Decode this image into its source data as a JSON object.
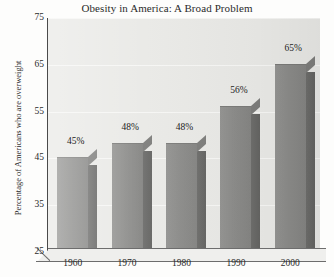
{
  "chart_data": {
    "type": "bar",
    "title": "Obesity in America: A Broad Problem",
    "xlabel": "",
    "ylabel": "Percentage of Americans who are overweight",
    "categories": [
      "1960",
      "1970",
      "1980",
      "1990",
      "2000"
    ],
    "values": [
      45,
      48,
      48,
      56,
      65
    ],
    "value_labels": [
      "45%",
      "48%",
      "48%",
      "56%",
      "65%"
    ],
    "ylim": [
      25,
      75
    ],
    "yticks": [
      25,
      35,
      45,
      55,
      65,
      75
    ],
    "ytick_labels": [
      "25",
      "35",
      "45",
      "55",
      "65",
      "75"
    ],
    "grid": true,
    "legend": false,
    "style": "3d-bar",
    "colors": {
      "bar_front": "#8b8b89",
      "bar_side": "#686866",
      "plot_background": "#e9e9e6",
      "figure_background": "#fdfdfc",
      "axis": "#4a4a4a",
      "gridline": "#f6f6f4",
      "text": "#2b2b2b"
    }
  }
}
